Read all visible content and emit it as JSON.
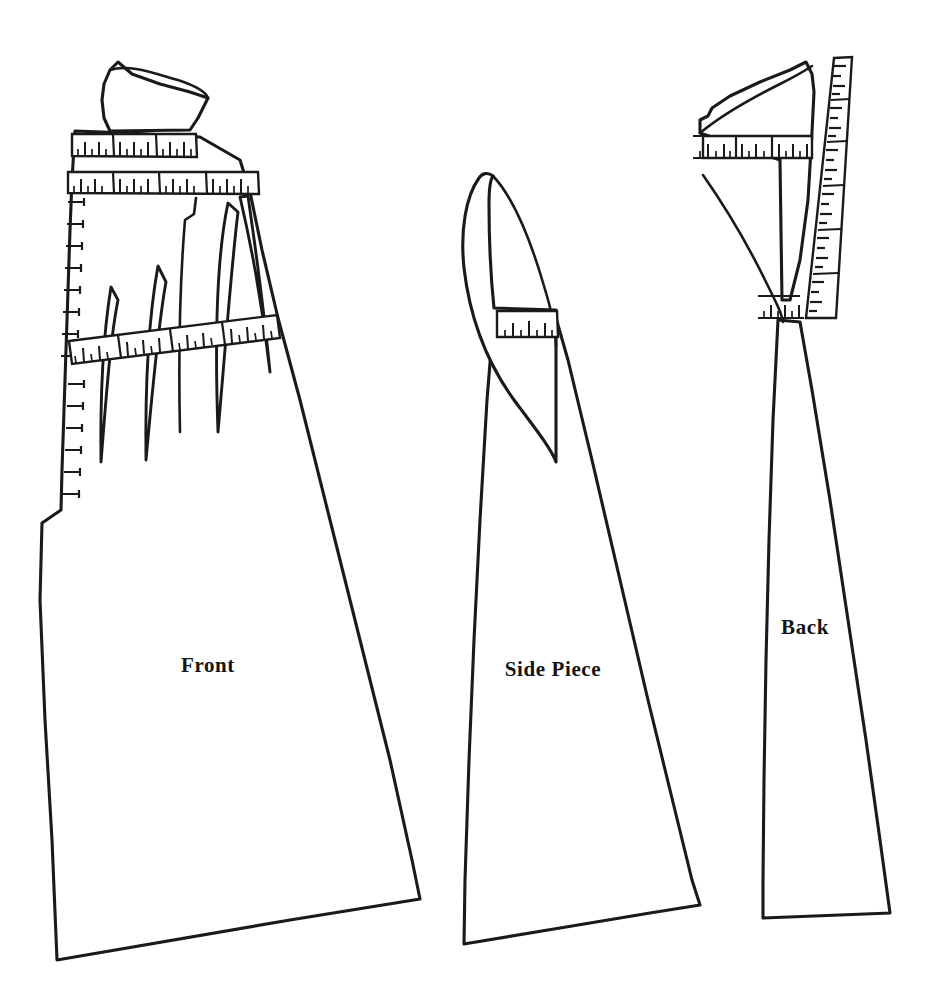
{
  "document": {
    "kind": "sewing-pattern-draft",
    "background_color": "#ffffff",
    "ink_color": "#1a1a1a",
    "width": 941,
    "height": 1004
  },
  "pieces": [
    {
      "id": "front",
      "label": "Front",
      "label_x": 208,
      "label_y": 672,
      "description": "Front bodice and skirt panel with four waist darts, shoulder yoke, horizontal measurement bands and a vertical left-edge scale."
    },
    {
      "id": "side-piece",
      "label": "Side Piece",
      "label_x": 553,
      "label_y": 676,
      "description": "Side gore panel with curved upper extension and a single measurement band at the waist."
    },
    {
      "id": "back",
      "label": "Back",
      "label_x": 805,
      "label_y": 634,
      "description": "Back panel with shoulder yoke, curved armhole edge, waist band and a long angled scale strip along the centre-back seam."
    }
  ],
  "rulers": {
    "front_band_upper": {
      "name": "front-upper-measurement-band",
      "segments": 3,
      "minor_ticks": 16
    },
    "front_band_lower": {
      "name": "front-lower-measurement-band",
      "segments": 4,
      "minor_ticks": 22
    },
    "front_band_waist": {
      "name": "front-waist-measurement-band",
      "segments": 4,
      "minor_ticks": 22
    },
    "front_scale_left": {
      "name": "front-left-vertical-scale",
      "ticks": 17
    },
    "side_band_waist": {
      "name": "side-waist-measurement-band",
      "segments": 1,
      "minor_ticks": 7
    },
    "back_band_upper": {
      "name": "back-upper-measurement-band",
      "segments": 3,
      "minor_ticks": 15
    },
    "back_band_waist": {
      "name": "back-waist-measurement-band",
      "segments": 1,
      "minor_ticks": 6
    },
    "back_scale_strip": {
      "name": "back-centre-scale-strip",
      "segments": 6,
      "ticks": 28
    }
  }
}
